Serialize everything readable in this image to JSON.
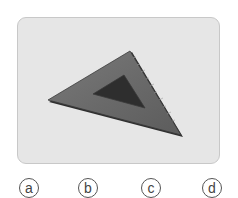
{
  "figure": {
    "card_color": "#e6e6e6",
    "ruler_color": "#6e6e6e"
  },
  "options": [
    {
      "label": "a"
    },
    {
      "label": "b"
    },
    {
      "label": "c"
    },
    {
      "label": "d"
    }
  ]
}
